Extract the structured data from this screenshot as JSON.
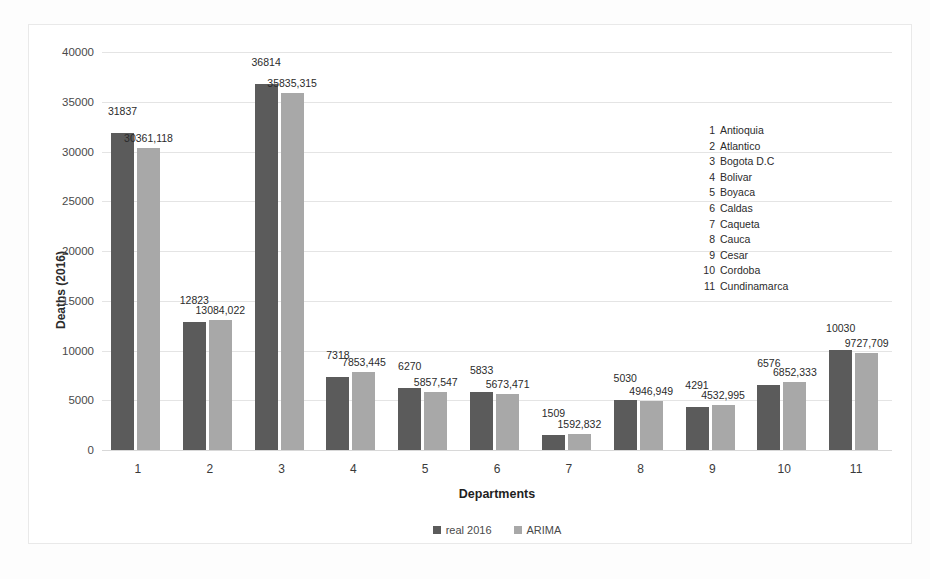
{
  "chart_data": {
    "type": "bar",
    "title": "",
    "xlabel": "Departments",
    "ylabel": "Deaths (2016)",
    "ylim": [
      0,
      40000
    ],
    "ytick_labels": [
      "40000",
      "35000",
      "30000",
      "25000",
      "20000",
      "15000",
      "10000",
      "5000",
      "0"
    ],
    "ytick_values": [
      40000,
      35000,
      30000,
      25000,
      20000,
      15000,
      10000,
      5000,
      0
    ],
    "grid": true,
    "legend_position": "bottom",
    "categories": [
      "1",
      "2",
      "3",
      "4",
      "5",
      "6",
      "7",
      "8",
      "9",
      "10",
      "11"
    ],
    "series": [
      {
        "name": "real 2016",
        "color": "#5b5b5b",
        "values": [
          31837,
          12823,
          36814,
          7318,
          6270,
          5833,
          1509,
          5030,
          4291,
          6576,
          10030
        ],
        "labels": [
          "31837",
          "12823",
          "36814",
          "7318",
          "6270",
          "5833",
          "1509",
          "5030",
          "4291",
          "6576",
          "10030"
        ]
      },
      {
        "name": "ARIMA",
        "color": "#a8a8a8",
        "values": [
          30361.118,
          13084.022,
          35835.315,
          7853.445,
          5857.547,
          5673.471,
          1592.832,
          4946.949,
          4532.995,
          6852.333,
          9727.709
        ],
        "labels": [
          "30361,118",
          "13084,022",
          "35835,315",
          "7853,445",
          "5857,547",
          "5673,471",
          "1592,832",
          "4946,949",
          "4532,995",
          "6852,333",
          "9727,709"
        ]
      }
    ],
    "annotations": {
      "department_key_title": "",
      "department_key": [
        {
          "num": "1",
          "name": "Antioquia"
        },
        {
          "num": "2",
          "name": "Atlantico"
        },
        {
          "num": "3",
          "name": "Bogota D.C"
        },
        {
          "num": "4",
          "name": "Bolivar"
        },
        {
          "num": "5",
          "name": "Boyaca"
        },
        {
          "num": "6",
          "name": "Caldas"
        },
        {
          "num": "7",
          "name": "Caqueta"
        },
        {
          "num": "8",
          "name": "Cauca"
        },
        {
          "num": "9",
          "name": "Cesar"
        },
        {
          "num": "10",
          "name": "Cordoba"
        },
        {
          "num": "11",
          "name": "Cundinamarca"
        }
      ]
    }
  }
}
